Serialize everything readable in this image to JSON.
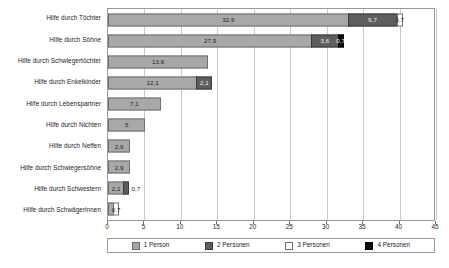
{
  "chart_data": {
    "type": "bar",
    "orientation": "horizontal",
    "stacked": true,
    "title": "",
    "subtitle": "",
    "xlabel": "",
    "ylabel": "",
    "xlim": [
      0,
      45
    ],
    "xticks": [
      0,
      5,
      10,
      15,
      20,
      25,
      30,
      35,
      40,
      45
    ],
    "xtick_labels": [
      "0",
      "5",
      "10",
      "15",
      "20",
      "25",
      "30",
      "35",
      "40",
      "45"
    ],
    "grid": true,
    "legend_position": "bottom",
    "categories": [
      "Hilfe durch Töchter",
      "Hilfe durch Söhne",
      "Hilfe durch Schwiegertöchter",
      "Hilfe durch Enkelkinder",
      "Hilfe durch Lebenspartner",
      "Hilfe durch Nichten",
      "Hilfe durch Neffen",
      "Hilfe durch Schwiegersöhne",
      "Hilfe durch Schwestern",
      "Hilfe durch Schwägerinnen"
    ],
    "series": [
      {
        "name": "1 Person",
        "color": "#a8a8a8",
        "values": [
          32.9,
          27.9,
          13.6,
          12.1,
          7.1,
          5,
          2.9,
          2.9,
          2.1,
          0.7
        ],
        "labels": [
          "32,9",
          "27,9",
          "13,6",
          "12,1",
          "7,1",
          "5",
          "2,9",
          "2,9",
          "2,1",
          ""
        ]
      },
      {
        "name": "2 Personen",
        "color": "#5e5e5e",
        "values": [
          6.7,
          3.6,
          0,
          2.1,
          0,
          0,
          0,
          0,
          0.7,
          0
        ],
        "labels": [
          "6,7",
          "3,6",
          "",
          "2,1",
          "",
          "",
          "",
          "",
          "",
          ""
        ]
      },
      {
        "name": "3 Personen",
        "color": "#ffffff",
        "values": [
          0.7,
          0,
          0,
          0,
          0,
          0,
          0,
          0,
          0,
          0.7
        ],
        "labels": [
          "0,7",
          "",
          "",
          "",
          "",
          "",
          "",
          "",
          "",
          "0,7"
        ]
      },
      {
        "name": "4 Personen",
        "color": "#0a0a0a",
        "values": [
          0,
          0.7,
          0,
          0,
          0,
          0,
          0,
          0,
          0,
          0
        ],
        "labels": [
          "",
          "0,7",
          "",
          "",
          "",
          "",
          "",
          "",
          "0,7",
          ""
        ]
      }
    ]
  }
}
